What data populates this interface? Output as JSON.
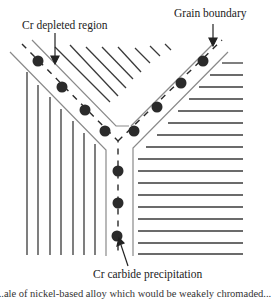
{
  "figure": {
    "labels": {
      "depleted_region": "Cr depleted region",
      "grain_boundary": "Grain boundary",
      "carbide_precipitation": "Cr carbide precipitation"
    },
    "caption_partial": "...ale of nickel-based alloy which would be weakely chromaded..."
  },
  "colors": {
    "grain_lines": "#3a3a3a",
    "band_lines": "#8a8a8a",
    "dots": "#2b2b2b",
    "arrows": "#222222"
  }
}
